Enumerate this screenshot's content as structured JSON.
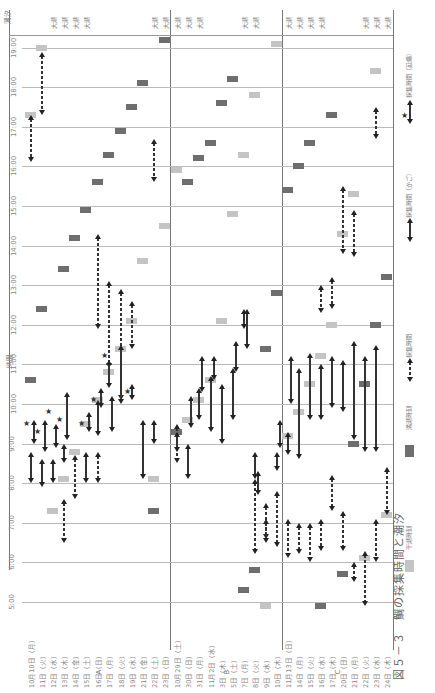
{
  "chart_data": {
    "type": "gantt-range",
    "orientation": "rotated 90° (time axis vertical, dates horizontal)",
    "xlabel": "月日",
    "ylabel": "時間",
    "top_label": "潮汐",
    "ylim": [
      5,
      19
    ],
    "yticks": [
      "5:00",
      "6:00",
      "7:00",
      "8:00",
      "9:00",
      "10:00",
      "11:00",
      "12:00",
      "13:00",
      "14:00",
      "15:00",
      "16:00",
      "17:00",
      "18:00",
      "19:00"
    ],
    "colors": {
      "high_tide": "#6e6e6e",
      "low_tide": "#c4c4c4",
      "line": "#333333"
    },
    "legend": [
      {
        "key": "low_tide",
        "label": "干潮時刻"
      },
      {
        "key": "high_tide",
        "label": "満潮時刻"
      },
      {
        "key": "dash",
        "label": "採集時間"
      },
      {
        "key": "solid",
        "label": "採集時間（かご）"
      },
      {
        "key": "star",
        "label": "採集時間（延縄）"
      }
    ],
    "sections": [
      {
        "name": "A",
        "dates": [
          {
            "label": "10月10日（月）",
            "x": 30,
            "tide": "",
            "high": 10.6,
            "low": 17.3,
            "dash": [
              [
                16.1,
                17.3
              ]
            ],
            "solid": [
              [
                8.0,
                8.8
              ],
              [
                9.0,
                9.6
              ]
            ],
            "star": [
              9.5
            ]
          },
          {
            "label": "11日（火）",
            "x": 41,
            "tide": "",
            "high": 12.4,
            "low": 19.0,
            "dash": [
              [
                17.3,
                18.9
              ]
            ],
            "solid": [
              [
                7.9,
                8.6
              ],
              [
                8.8,
                9.6
              ]
            ],
            "star": [
              9.3
            ]
          },
          {
            "label": "12日（水）",
            "x": 52,
            "tide": "大潮",
            "high": null,
            "low": 7.3,
            "dash": [],
            "solid": [
              [
                8.0,
                8.6
              ],
              [
                8.9,
                9.5
              ]
            ],
            "star": [
              9.8
            ]
          },
          {
            "label": "13日（木）",
            "x": 63,
            "tide": "大潮",
            "high": 13.4,
            "low": 8.1,
            "dash": [
              [
                7.6,
                6.5
              ]
            ],
            "solid": [
              [
                8.5,
                9.0
              ],
              [
                9.1,
                10.3
              ]
            ],
            "star": [
              9.6
            ]
          },
          {
            "label": "14日（金）",
            "x": 74,
            "tide": "大潮",
            "high": 14.2,
            "low": 8.8,
            "dash": [
              [
                7.6,
                8.7
              ]
            ],
            "solid": [],
            "star": []
          },
          {
            "label": "15日（土）",
            "x": 85,
            "tide": "大潮",
            "high": 14.9,
            "low": 9.5,
            "dash": [],
            "solid": [
              [
                8.0,
                8.8
              ],
              [
                9.3,
                9.8
              ]
            ],
            "star": [
              9.5
            ]
          },
          {
            "label": "16日（日）",
            "x": 97,
            "tide": "",
            "high": 15.6,
            "low": 10.1,
            "dash": [
              [
                11.9,
                14.3
              ],
              [
                8.0,
                8.8
              ]
            ],
            "solid": [
              [
                9.2,
                10.1
              ],
              [
                9.9,
                10.4
              ]
            ],
            "star": [
              10.1
            ]
          },
          {
            "label": "17日（月）",
            "x": 108,
            "tide": "",
            "high": 16.3,
            "low": 10.8,
            "dash": [
              [
                10.9,
                13.1
              ]
            ],
            "solid": [
              [
                10.4,
                11.1
              ],
              [
                9.3,
                10.2
              ]
            ],
            "star": [
              11.2
            ]
          },
          {
            "label": "18日（火）",
            "x": 120,
            "tide": "",
            "high": 16.9,
            "low": 11.4,
            "dash": [
              [
                10.1,
                12.9
              ]
            ],
            "solid": [
              [
                10.0,
                11.5
              ]
            ],
            "star": []
          },
          {
            "label": "19日（水）",
            "x": 131,
            "tide": "",
            "high": 17.5,
            "low": 12.1,
            "dash": [
              [
                11.4,
                12.6
              ]
            ],
            "solid": [
              [
                10.1,
                10.5
              ]
            ],
            "star": [
              10.3
            ]
          },
          {
            "label": "21日（金）",
            "x": 142,
            "tide": "",
            "high": 18.1,
            "low": 13.6,
            "dash": [],
            "solid": [
              [
                8.1,
                9.6
              ]
            ],
            "star": []
          },
          {
            "label": "22日（土）",
            "x": 153,
            "tide": "大潮",
            "high": 7.3,
            "low": 8.1,
            "dash": [
              [
                15.6,
                16.7
              ]
            ],
            "solid": [
              [
                9.0,
                9.6
              ]
            ],
            "star": []
          },
          {
            "label": "23日（日）",
            "x": 164,
            "tide": "大潮",
            "high": 19.2,
            "low": 14.5,
            "dash": [],
            "solid": [],
            "star": []
          }
        ]
      },
      {
        "name": "B",
        "dates": [
          {
            "label": "10月29日（土）",
            "x": 176,
            "tide": "大潮",
            "high": 9.3,
            "low": 15.9,
            "dash": [
              [
                8.5,
                9.5
              ]
            ],
            "solid": [
              [
                8.8,
                9.3
              ]
            ],
            "star": []
          },
          {
            "label": "30日（日）",
            "x": 187,
            "tide": "大潮",
            "high": 15.6,
            "low": 9.6,
            "dash": [],
            "solid": [
              [
                8.1,
                9.0
              ],
              [
                9.4,
                10.2
              ]
            ],
            "star": []
          },
          {
            "label": "31日（月）",
            "x": 198,
            "tide": "大潮",
            "high": 16.2,
            "low": 10.1,
            "dash": [],
            "solid": [
              [
                9.6,
                10.4
              ],
              [
                10.3,
                11.2
              ]
            ],
            "star": []
          },
          {
            "label": "11月2日（水）",
            "x": 210,
            "tide": "",
            "high": 16.6,
            "low": 10.6,
            "dash": [],
            "solid": [
              [
                9.3,
                10.7
              ],
              [
                10.6,
                11.2
              ]
            ],
            "star": []
          },
          {
            "label": "3日（木）",
            "x": 221,
            "tide": "",
            "high": 17.6,
            "low": 12.1,
            "dash": [],
            "solid": [
              [
                9.0,
                10.5
              ]
            ],
            "star": []
          },
          {
            "label": "5日（土）",
            "x": 232,
            "tide": "",
            "high": 18.2,
            "low": 14.8,
            "dash": [],
            "solid": [
              [
                9.6,
                10.9
              ],
              [
                10.8,
                11.6
              ]
            ],
            "star": []
          },
          {
            "label": "7日（月）",
            "x": 243,
            "tide": "大潮",
            "high": 5.3,
            "low": 16.3,
            "dash": [],
            "solid": [
              [
                11.9,
                12.4
              ],
              [
                11.4,
                12.4
              ]
            ],
            "star": []
          },
          {
            "label": "8日（火）",
            "x": 254,
            "tide": "大潮",
            "high": 5.8,
            "low": 17.8,
            "dash": [
              [
                6.2,
                8.1
              ]
            ],
            "solid": [
              [
                8.1,
                8.8
              ],
              [
                7.7,
                8.3
              ]
            ],
            "star": []
          },
          {
            "label": "9日（水）",
            "x": 265,
            "tide": "",
            "high": 11.4,
            "low": 4.9,
            "dash": [
              [
                6.6,
                7.5
              ],
              [
                6.5,
                7.1
              ]
            ],
            "solid": [],
            "star": []
          },
          {
            "label": "10日（木）",
            "x": 276,
            "tide": "",
            "high": 12.8,
            "low": 19.1,
            "dash": [
              [
                6.4,
                7.8
              ]
            ],
            "solid": [
              [
                8.3,
                8.8
              ],
              [
                8.9,
                9.6
              ]
            ],
            "star": []
          }
        ]
      },
      {
        "name": "C",
        "dates": [
          {
            "label": "11月13日（日）",
            "x": 287,
            "tide": "大潮",
            "high": 15.4,
            "low": 9.2,
            "dash": [
              [
                6.1,
                7.1
              ]
            ],
            "solid": [
              [
                8.7,
                9.3
              ],
              [
                10.0,
                11.2
              ]
            ],
            "star": []
          },
          {
            "label": "14日（月）",
            "x": 298,
            "tide": "大潮",
            "high": 16.0,
            "low": 9.8,
            "dash": [
              [
                6.2,
                7.0
              ]
            ],
            "solid": [
              [
                8.6,
                10.9
              ]
            ],
            "star": []
          },
          {
            "label": "15日（火）",
            "x": 309,
            "tide": "大潮",
            "high": 16.6,
            "low": 10.5,
            "dash": [
              [
                6.0,
                7.0
              ]
            ],
            "solid": [
              [
                9.6,
                11.3
              ]
            ],
            "star": []
          },
          {
            "label": "16日（水）",
            "x": 320,
            "tide": "大潮",
            "high": 4.9,
            "low": 11.2,
            "dash": [
              [
                6.3,
                7.1
              ],
              [
                12.3,
                13.0
              ]
            ],
            "solid": [
              [
                9.6,
                11.0
              ]
            ],
            "star": []
          },
          {
            "label": "17日（木）",
            "x": 331,
            "tide": "",
            "high": 17.3,
            "low": 12.0,
            "dash": [
              [
                7.3,
                8.2
              ],
              [
                12.4,
                13.2
              ]
            ],
            "solid": [
              [
                9.9,
                11.2
              ]
            ],
            "star": []
          },
          {
            "label": "20日（日）",
            "x": 342,
            "tide": "",
            "high": 5.7,
            "low": 14.3,
            "dash": [
              [
                13.8,
                15.5
              ],
              [
                6.3,
                7.3
              ]
            ],
            "solid": [
              [
                9.8,
                11.1
              ]
            ],
            "star": []
          },
          {
            "label": "21日（月）",
            "x": 353,
            "tide": "",
            "high": 9.0,
            "low": 15.3,
            "dash": [
              [
                13.7,
                14.9
              ],
              [
                5.5,
                6.0
              ]
            ],
            "solid": [
              [
                9.1,
                11.6
              ]
            ],
            "star": []
          },
          {
            "label": "22日（火）",
            "x": 364,
            "tide": "大潮",
            "high": 10.5,
            "low": 6.1,
            "dash": [
              [
                4.9,
                6.3
              ]
            ],
            "solid": [
              [
                8.8,
                11.2
              ]
            ],
            "star": []
          },
          {
            "label": "23日（水）",
            "x": 375,
            "tide": "大潮",
            "high": 12.0,
            "low": 18.4,
            "dash": [
              [
                6.0,
                7.1
              ],
              [
                16.7,
                17.5
              ]
            ],
            "solid": [
              [
                8.8,
                11.5
              ]
            ],
            "star": []
          },
          {
            "label": "24日（木）",
            "x": 386,
            "tide": "大潮",
            "high": 13.2,
            "low": 7.2,
            "dash": [
              [
                7.2,
                8.4
              ]
            ],
            "solid": [],
            "star": []
          }
        ]
      }
    ]
  },
  "labels": {
    "top_axis": "潮汐",
    "time_axis": "時間",
    "caption": "図５－３　鯛の採集時間と潮汐",
    "section_a": "A",
    "section_b": "B",
    "section_c": "C"
  }
}
